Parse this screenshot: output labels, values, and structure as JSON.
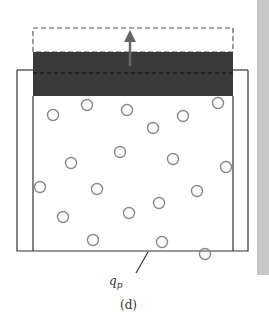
{
  "figure": {
    "caption": "(d)",
    "heat_label": "q",
    "heat_label_sub": "p",
    "colors": {
      "piston": "#3a3a3a",
      "outline": "#333333",
      "particle": "#888888",
      "side_strip": "#c8c8c8"
    },
    "particles": [
      [
        53,
        115
      ],
      [
        87,
        105
      ],
      [
        127,
        110
      ],
      [
        183,
        116
      ],
      [
        153,
        128
      ],
      [
        218,
        103
      ],
      [
        71,
        163
      ],
      [
        120,
        152
      ],
      [
        173,
        159
      ],
      [
        226,
        167
      ],
      [
        40,
        187
      ],
      [
        97,
        189
      ],
      [
        197,
        191
      ],
      [
        159,
        203
      ],
      [
        63,
        217
      ],
      [
        129,
        213
      ],
      [
        93,
        240
      ],
      [
        162,
        242
      ],
      [
        205,
        254
      ]
    ]
  }
}
